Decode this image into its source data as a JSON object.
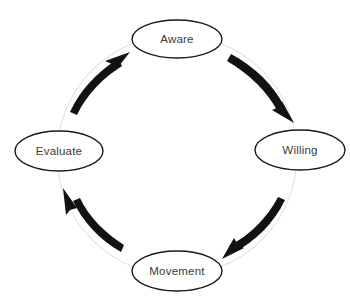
{
  "diagram": {
    "type": "cycle",
    "direction": "clockwise",
    "background_color": "#ffffff",
    "node_stroke_color": "#1a1a1a",
    "node_fill_color": "#ffffff",
    "label_color": "#3a3a3a",
    "arrow_color": "#121212",
    "guide_circle_color": "#e2e2e2",
    "nodes": [
      {
        "id": "aware",
        "label": "Aware",
        "cx": 177,
        "cy": 39,
        "rx": 45,
        "ry": 19,
        "angle_deg": 270
      },
      {
        "id": "willing",
        "label": "Willing",
        "cx": 300,
        "cy": 150,
        "rx": 45,
        "ry": 20,
        "angle_deg": 0
      },
      {
        "id": "movement",
        "label": "Movement",
        "cx": 177,
        "cy": 271,
        "rx": 45,
        "ry": 20,
        "angle_deg": 90
      },
      {
        "id": "evaluate",
        "label": "Evaluate",
        "cx": 59,
        "cy": 151,
        "rx": 44,
        "ry": 20,
        "angle_deg": 180
      }
    ],
    "edges": [
      {
        "id": "aware-to-willing",
        "from": "Aware",
        "to": "Willing"
      },
      {
        "id": "willing-to-movement",
        "from": "Willing",
        "to": "Movement"
      },
      {
        "id": "movement-to-evaluate",
        "from": "Movement",
        "to": "Evaluate"
      },
      {
        "id": "evaluate-to-aware",
        "from": "Evaluate",
        "to": "Aware"
      }
    ],
    "guide_circle": {
      "cx": 177,
      "cy": 155,
      "r": 120
    }
  }
}
